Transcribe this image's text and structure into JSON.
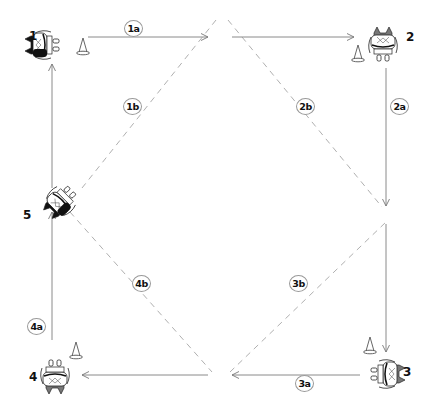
{
  "diagram": {
    "type": "football-drill",
    "players": [
      {
        "id": "1",
        "label": "1",
        "x": 45,
        "y": 45,
        "facing": "right"
      },
      {
        "id": "2",
        "label": "2",
        "x": 383,
        "y": 47,
        "facing": "down"
      },
      {
        "id": "3",
        "label": "3",
        "x": 385,
        "y": 374,
        "facing": "left"
      },
      {
        "id": "4",
        "label": "4",
        "x": 55,
        "y": 374,
        "facing": "up"
      },
      {
        "id": "5",
        "label": "5",
        "x": 62,
        "y": 200,
        "facing": "up-right"
      }
    ],
    "cones": [
      {
        "near": "1",
        "x": 83,
        "y": 48
      },
      {
        "near": "2",
        "x": 358,
        "y": 55
      },
      {
        "near": "3",
        "x": 370,
        "y": 347
      },
      {
        "near": "4",
        "x": 76,
        "y": 352
      }
    ],
    "step_labels": [
      {
        "text": "1a",
        "x": 133,
        "y": 28
      },
      {
        "text": "1b",
        "x": 132,
        "y": 106
      },
      {
        "text": "2b",
        "x": 305,
        "y": 106
      },
      {
        "text": "2a",
        "x": 399,
        "y": 106
      },
      {
        "text": "3b",
        "x": 298,
        "y": 283
      },
      {
        "text": "4b",
        "x": 141,
        "y": 283
      },
      {
        "text": "4a",
        "x": 36,
        "y": 326
      },
      {
        "text": "3a",
        "x": 304,
        "y": 383
      }
    ],
    "solid_arrows": [
      {
        "name": "pass-1a-first",
        "from": [
          88,
          37
        ],
        "to": [
          208,
          37
        ]
      },
      {
        "name": "pass-1a-second",
        "from": [
          232,
          37
        ],
        "to": [
          354,
          37
        ]
      },
      {
        "name": "pass-2a-first",
        "from": [
          386,
          68
        ],
        "to": [
          386,
          206
        ]
      },
      {
        "name": "pass-2a-second",
        "from": [
          386,
          224
        ],
        "to": [
          386,
          352
        ]
      },
      {
        "name": "pass-3a-first",
        "from": [
          360,
          375
        ],
        "to": [
          232,
          375
        ]
      },
      {
        "name": "pass-3a-second",
        "from": [
          208,
          375
        ],
        "to": [
          82,
          375
        ]
      },
      {
        "name": "pass-4a-first",
        "from": [
          52,
          340
        ],
        "to": [
          52,
          212
        ]
      },
      {
        "name": "pass-4a-second",
        "from": [
          52,
          188
        ],
        "to": [
          52,
          64
        ]
      }
    ],
    "dashed_lines": [
      {
        "name": "run-1b",
        "from": [
          216,
          20
        ],
        "to": [
          82,
          188
        ]
      },
      {
        "name": "run-2b",
        "from": [
          228,
          20
        ],
        "to": [
          382,
          207
        ]
      },
      {
        "name": "run-4b",
        "from": [
          70,
          212
        ],
        "to": [
          212,
          372
        ]
      },
      {
        "name": "run-3b",
        "from": [
          230,
          372
        ],
        "to": [
          386,
          222
        ]
      }
    ],
    "colors": {
      "line": "#8a8a8a",
      "dashed": "#b0b0b0",
      "player_dark": "#111111",
      "player_shade": "#777777",
      "cone": "#555555"
    }
  }
}
